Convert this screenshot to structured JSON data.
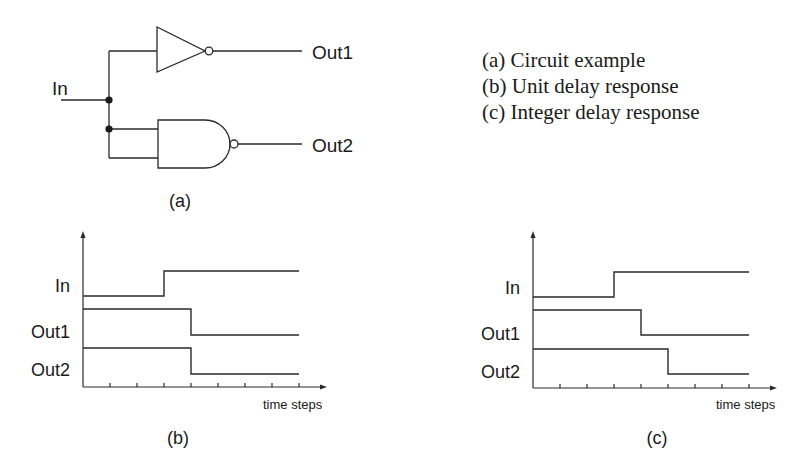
{
  "circuit": {
    "caption": "(a)",
    "input_label": "In",
    "output1_label": "Out1",
    "output2_label": "Out2",
    "gates": [
      {
        "type": "inverter",
        "output": "Out1"
      },
      {
        "type": "nand",
        "output": "Out2"
      }
    ]
  },
  "legend": {
    "items": [
      "(a) Circuit example",
      "(b) Unit delay response",
      "(c) Integer delay response"
    ]
  },
  "timing_b": {
    "caption": "(b)",
    "x_axis_label": "time steps",
    "signals": [
      {
        "name": "In",
        "initial": 0,
        "transition_step": 3
      },
      {
        "name": "Out1",
        "initial": 1,
        "transition_step": 4
      },
      {
        "name": "Out2",
        "initial": 1,
        "transition_step": 4
      }
    ],
    "ticks": 8
  },
  "timing_c": {
    "caption": "(c)",
    "x_axis_label": "time steps",
    "signals": [
      {
        "name": "In",
        "initial": 0,
        "transition_step": 3
      },
      {
        "name": "Out1",
        "initial": 1,
        "transition_step": 4
      },
      {
        "name": "Out2",
        "initial": 1,
        "transition_step": 5
      }
    ],
    "ticks": 8
  },
  "colors": {
    "line": "#2a2a2a",
    "text": "#1a1a1a",
    "background": "#ffffff"
  }
}
